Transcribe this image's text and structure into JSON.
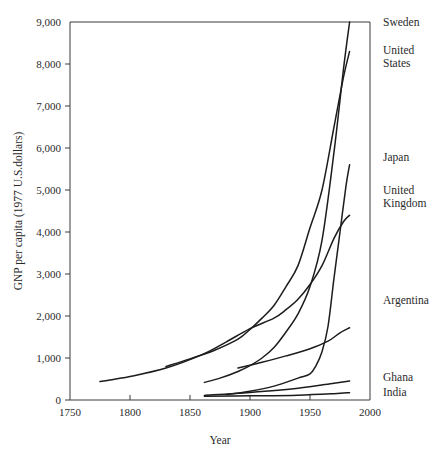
{
  "chart_data": {
    "type": "line",
    "title": "",
    "xlabel": "Year",
    "ylabel": "GNP per capita (1977 U.S.dollars)",
    "xlim": [
      1750,
      2000
    ],
    "ylim": [
      0,
      9000
    ],
    "grid": false,
    "legend_position": "right-of-plot-inline",
    "xticks": [
      1750,
      1800,
      1850,
      1900,
      1950,
      2000
    ],
    "xticklabels": [
      "1750",
      "1800",
      "1850",
      "1900",
      "1950",
      "2000"
    ],
    "yticks": [
      0,
      1000,
      2000,
      3000,
      4000,
      5000,
      6000,
      7000,
      8000,
      9000
    ],
    "yticklabels": [
      "0",
      "1,000",
      "2,000",
      "3,000",
      "4,000",
      "5,000",
      "6,000",
      "7,000",
      "8,000",
      "9,000"
    ],
    "series": [
      {
        "name": "Sweden",
        "label": "Sweden",
        "label_lines": [
          "Sweden"
        ],
        "x": [
          1862,
          1875,
          1890,
          1900,
          1910,
          1920,
          1930,
          1940,
          1950,
          1960,
          1970,
          1978,
          1983
        ],
        "values": [
          420,
          520,
          680,
          820,
          1000,
          1250,
          1620,
          2050,
          2700,
          3800,
          5900,
          7900,
          9000
        ]
      },
      {
        "name": "United States",
        "label": "United States",
        "label_lines": [
          "United",
          "States"
        ],
        "x": [
          1830,
          1850,
          1870,
          1890,
          1900,
          1910,
          1920,
          1930,
          1940,
          1950,
          1960,
          1970,
          1978,
          1983
        ],
        "values": [
          800,
          980,
          1180,
          1450,
          1680,
          1950,
          2250,
          2700,
          3200,
          4100,
          5000,
          6500,
          7700,
          8300
        ]
      },
      {
        "name": "Japan",
        "label": "Japan",
        "label_lines": [
          "Japan"
        ],
        "x": [
          1880,
          1900,
          1920,
          1940,
          1950,
          1955,
          1960,
          1965,
          1970,
          1975,
          1980,
          1983
        ],
        "values": [
          130,
          210,
          330,
          520,
          620,
          820,
          1150,
          1750,
          2900,
          4000,
          5100,
          5600
        ]
      },
      {
        "name": "United Kingdom",
        "label": "United Kingdom",
        "label_lines": [
          "United",
          "Kingdom"
        ],
        "x": [
          1775,
          1800,
          1830,
          1860,
          1880,
          1900,
          1920,
          1930,
          1940,
          1950,
          1960,
          1970,
          1978,
          1983
        ],
        "values": [
          440,
          560,
          760,
          1080,
          1380,
          1700,
          1950,
          2150,
          2400,
          2750,
          3200,
          3850,
          4250,
          4400
        ]
      },
      {
        "name": "Argentina",
        "label": "Argentina",
        "label_lines": [
          "Argentina"
        ],
        "x": [
          1890,
          1910,
          1930,
          1950,
          1965,
          1975,
          1983
        ],
        "values": [
          760,
          900,
          1050,
          1220,
          1400,
          1600,
          1720
        ]
      },
      {
        "name": "Ghana",
        "label": "Ghana",
        "label_lines": [
          "Ghana"
        ],
        "x": [
          1862,
          1900,
          1940,
          1970,
          1983
        ],
        "values": [
          110,
          180,
          280,
          400,
          450
        ]
      },
      {
        "name": "India",
        "label": "India",
        "label_lines": [
          "India"
        ],
        "x": [
          1862,
          1900,
          1940,
          1970,
          1983
        ],
        "values": [
          90,
          100,
          115,
          150,
          175
        ]
      }
    ]
  }
}
